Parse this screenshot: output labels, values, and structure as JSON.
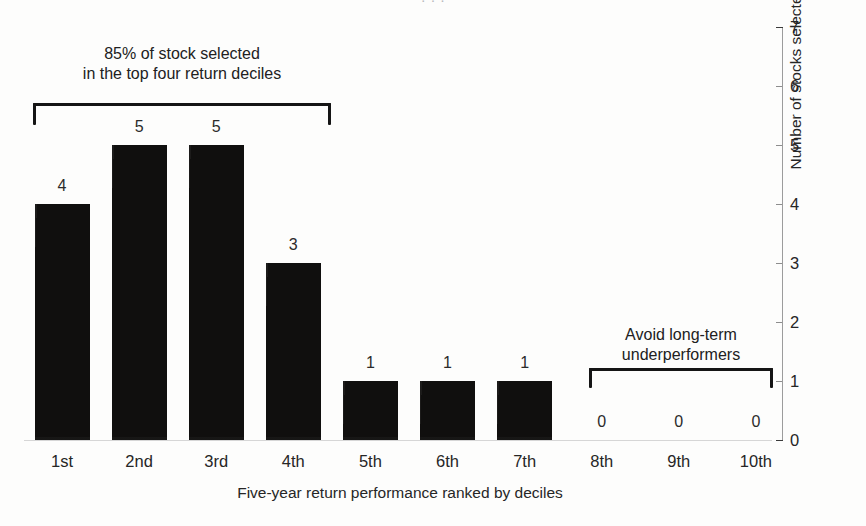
{
  "figure": {
    "title_remnant": "· · ·",
    "background_color": "#fdfdfc",
    "bar_color": "#100f0e"
  },
  "chart_data": {
    "type": "bar",
    "title": "",
    "subtitle": "",
    "categories": [
      "1st",
      "2nd",
      "3rd",
      "4th",
      "5th",
      "6th",
      "7th",
      "8th",
      "9th",
      "10th"
    ],
    "values": [
      4,
      5,
      5,
      3,
      1,
      1,
      1,
      0,
      0,
      0
    ],
    "value_labels": [
      "4",
      "5",
      "5",
      "3",
      "1",
      "1",
      "1",
      "0",
      "0",
      "0"
    ],
    "xlabel": "Five-year return performance ranked by deciles",
    "ylabel": "Number of stocks selected by return decile",
    "ylim": [
      0,
      7
    ],
    "ytick_labels": [
      "0",
      "1",
      "2",
      "3",
      "4",
      "5",
      "6",
      "7"
    ],
    "yaxis_position": "right",
    "grid": false,
    "legend": null,
    "annotations": [
      {
        "id": "top-deciles",
        "text_line_1": "85% of stock selected",
        "text_line_2": "in the top four return deciles",
        "bracket_spans_categories": [
          "1st",
          "2nd",
          "3rd",
          "4th"
        ]
      },
      {
        "id": "underperformers",
        "text_line_1": "Avoid long-term",
        "text_line_2": "underperformers",
        "bracket_spans_categories": [
          "8th",
          "9th",
          "10th"
        ]
      }
    ]
  }
}
